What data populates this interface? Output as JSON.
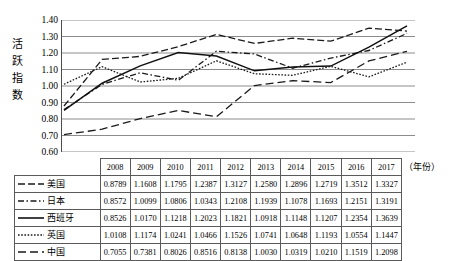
{
  "y_axis_title": [
    "活",
    "跃",
    "指",
    "数"
  ],
  "x_unit_note": "（年份）",
  "chart_data": {
    "type": "line",
    "title": "",
    "xlabel": "（年份）",
    "ylabel": "活跃指数",
    "grid": true,
    "legend_position": "table-left",
    "ylim": [
      0.6,
      1.4
    ],
    "ytick_labels": [
      "1.40",
      "1.30",
      "1.20",
      "1.10",
      "1.00",
      "0.90",
      "0.80",
      "0.70",
      "0.60"
    ],
    "ytick_values": [
      1.4,
      1.3,
      1.2,
      1.1,
      1.0,
      0.9,
      0.8,
      0.7,
      0.6
    ],
    "categories": [
      "2008",
      "2009",
      "2010",
      "2011",
      "2012",
      "2013",
      "2014",
      "2015",
      "2016",
      "2017"
    ],
    "series": [
      {
        "name": "美国",
        "line_style": "long-dash",
        "dash_pattern": "7,3",
        "color": "#1a1a1a",
        "values": [
          0.8789,
          1.1608,
          1.1795,
          1.2387,
          1.3127,
          1.258,
          1.2896,
          1.2719,
          1.3512,
          1.3327
        ]
      },
      {
        "name": "日本",
        "line_style": "dash-dot",
        "dash_pattern": "6,2.5,1.5,2.5",
        "color": "#1a1a1a",
        "values": [
          0.8572,
          1.0099,
          1.0806,
          1.0343,
          1.2108,
          1.1939,
          1.1078,
          1.1693,
          1.2151,
          1.3191
        ]
      },
      {
        "name": "西班牙",
        "line_style": "solid",
        "dash_pattern": "none",
        "color": "#111111",
        "values": [
          0.8526,
          1.017,
          1.1218,
          1.2023,
          1.1821,
          1.0918,
          1.1148,
          1.1207,
          1.2354,
          1.3639
        ]
      },
      {
        "name": "英国",
        "line_style": "dotted",
        "dash_pattern": "1.6,1.6",
        "color": "#1a1a1a",
        "values": [
          1.0108,
          1.1174,
          1.0241,
          1.0466,
          1.1526,
          1.0741,
          1.0648,
          1.1193,
          1.0554,
          1.1447
        ]
      },
      {
        "name": "中国",
        "line_style": "spaced-dash",
        "dash_pattern": "8,4",
        "color": "#1a1a1a",
        "values": [
          0.7055,
          0.7381,
          0.8026,
          0.8516,
          0.8138,
          1.003,
          1.0319,
          1.021,
          1.1519,
          1.2098
        ]
      }
    ]
  },
  "table": {
    "corner_label": "",
    "columns": [
      "2008",
      "2009",
      "2010",
      "2011",
      "2012",
      "2013",
      "2014",
      "2015",
      "2016",
      "2017"
    ],
    "rows": [
      {
        "label": "美国",
        "values": [
          "0.8789",
          "1.1608",
          "1.1795",
          "1.2387",
          "1.3127",
          "1.2580",
          "1.2896",
          "1.2719",
          "1.3512",
          "1.3327"
        ]
      },
      {
        "label": "日本",
        "values": [
          "0.8572",
          "1.0099",
          "1.0806",
          "1.0343",
          "1.2108",
          "1.1939",
          "1.1078",
          "1.1693",
          "1.2151",
          "1.3191"
        ]
      },
      {
        "label": "西班牙",
        "values": [
          "0.8526",
          "1.0170",
          "1.1218",
          "1.2023",
          "1.1821",
          "1.0918",
          "1.1148",
          "1.1207",
          "1.2354",
          "1.3639"
        ]
      },
      {
        "label": "英国",
        "values": [
          "1.0108",
          "1.1174",
          "1.0241",
          "1.0466",
          "1.1526",
          "1.0741",
          "1.0648",
          "1.1193",
          "1.0554",
          "1.1447"
        ]
      },
      {
        "label": "中国",
        "values": [
          "0.7055",
          "0.7381",
          "0.8026",
          "0.8516",
          "0.8138",
          "1.0030",
          "1.0319",
          "1.0210",
          "1.1519",
          "1.2098"
        ]
      }
    ]
  }
}
